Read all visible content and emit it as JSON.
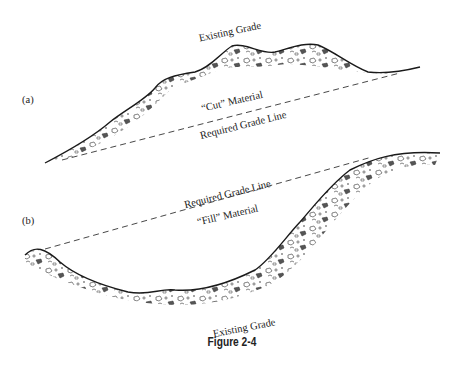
{
  "figure": {
    "caption": "Figure 2-4",
    "panels": [
      {
        "id": "a",
        "label": "(a)",
        "existing_grade_label": "Existing Grade",
        "material_label": "“Cut” Material",
        "required_grade_label": "Required Grade Line"
      },
      {
        "id": "b",
        "label": "(b)",
        "existing_grade_label": "Existing Grade",
        "material_label": "“Fill” Material",
        "required_grade_label": "Required Grade Line"
      }
    ]
  },
  "colors": {
    "line": "#1a1a1a",
    "rock_fill": "#555555",
    "background": "#ffffff"
  }
}
